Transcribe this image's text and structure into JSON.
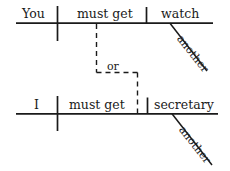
{
  "diagram": {
    "type": "reed-kellogg-sentence-diagram",
    "title": "",
    "ink_color": "#1a1a1a",
    "background_color": "#ffffff",
    "clauses": [
      {
        "id": "clause-top",
        "subject": "You",
        "verb": "must get",
        "object": "watch",
        "object_modifier": "another"
      },
      {
        "id": "clause-bottom",
        "subject": "I",
        "verb": "must get",
        "object": "secretary",
        "object_modifier": "another"
      }
    ],
    "conjunction": "or",
    "conjunction_line_style": "dashed"
  }
}
